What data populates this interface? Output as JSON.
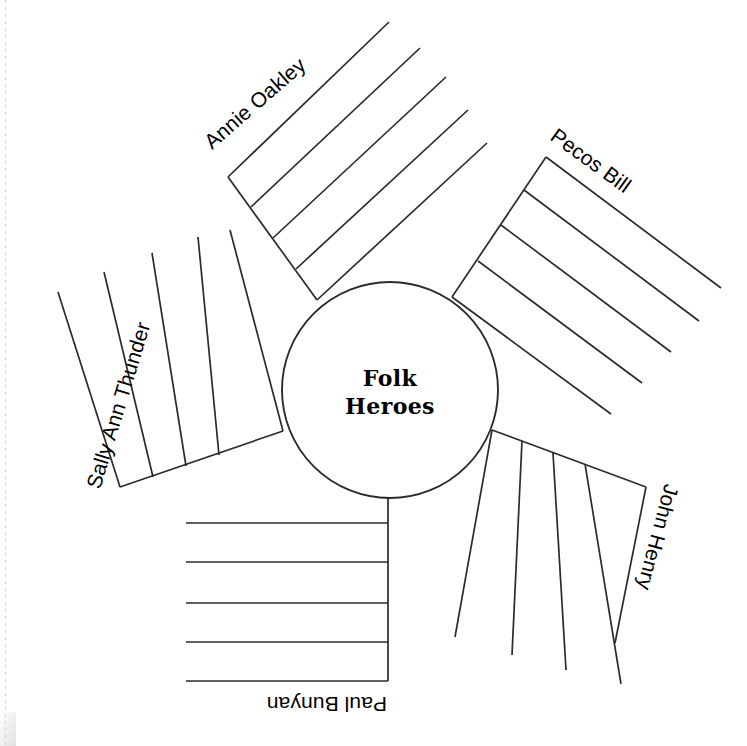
{
  "worksheet": {
    "type": "graphic-organizer",
    "shape": "radial-spoke-web",
    "center": {
      "label_line_1": "Folk",
      "label_line_2": "Heroes",
      "full_label": "Folk Heroes",
      "radius_px": 108,
      "cx": 390,
      "cy": 390
    },
    "colors": {
      "background": "#ffffff",
      "stroke": "#2b2b2b",
      "text": "#000000"
    },
    "spoke_count": 5,
    "lines_per_spoke": 5,
    "spokes": [
      {
        "id": "annie-oakley",
        "label": "Annie Oakley",
        "direction": "upper-left",
        "angle_deg": -131,
        "label_rotation_deg": -37,
        "text_direction": "bottom-left-to-top-right"
      },
      {
        "id": "pecos-bill",
        "label": "Pecos Bill",
        "direction": "upper-right",
        "angle_deg": -56,
        "label_rotation_deg": 34,
        "text_direction": "top-left-to-bottom-right"
      },
      {
        "id": "john-henry",
        "label": "John Henry",
        "direction": "lower-right",
        "angle_deg": 20,
        "label_rotation_deg": 110,
        "text_direction": "top-to-bottom"
      },
      {
        "id": "paul-bunyan",
        "label": "Paul Bunyan",
        "direction": "down",
        "angle_deg": 90,
        "label_rotation_deg": 180,
        "text_direction": "upside-down"
      },
      {
        "id": "sally-ann-thunder",
        "label": "Sally Ann Thunder",
        "direction": "left",
        "angle_deg": 161,
        "label_rotation_deg": -71,
        "text_direction": "bottom-to-top"
      }
    ]
  }
}
